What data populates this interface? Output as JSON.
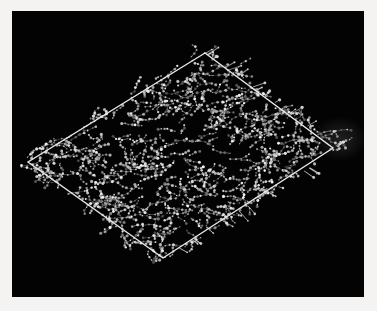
{
  "figure": {
    "domain": "scientific-visualization",
    "title": "",
    "caption": "",
    "margin_color": "#f4f3f1",
    "viewport": {
      "background_color": "#030303",
      "x": 12,
      "y": 11,
      "width": 352,
      "height": 286
    }
  },
  "scene": {
    "box": {
      "name": "simulation-box",
      "edge_color": "#e8e8e8",
      "edge_width": 1.4,
      "vertices": {
        "top": {
          "x": 193,
          "y": 42
        },
        "right": {
          "x": 321,
          "y": 137
        },
        "bottom": {
          "x": 151,
          "y": 247
        },
        "left": {
          "x": 16,
          "y": 151
        }
      },
      "vertex_order": [
        "top",
        "right",
        "bottom",
        "left"
      ]
    },
    "particles": {
      "name": "molecule-beads",
      "color_bright": "#f2f2f2",
      "color_mid": "#b9b9b9",
      "color_dim": "#6e6e6e",
      "bond_color": "#8f8f8f",
      "count_approx": 2600,
      "bead_radius_px": [
        0.7,
        1.6
      ],
      "layout": "uniform-random-within-box-plus-overflow"
    },
    "whiskers": {
      "name": "protruding-tails",
      "color": "#dcdcdc",
      "count_approx": 34,
      "length_px": [
        4,
        13
      ],
      "note": "short sticks crossing the lower-right and right box edges"
    },
    "halo": {
      "name": "faint-ghost-blob",
      "color": "#1a1a1a",
      "cx": 328,
      "cy": 128,
      "rx": 26,
      "ry": 22
    }
  },
  "chart_data": {
    "type": "scatter",
    "title": "",
    "xlabel": "",
    "ylabel": "",
    "legend": [],
    "grid": false,
    "note": "Particle positions are procedurally sampled inside the parallelogram projection of the simulation box; no numeric axes are shown in the source image."
  }
}
